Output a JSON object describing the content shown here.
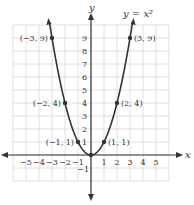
{
  "chart_data": {
    "type": "line",
    "title": "y = x²",
    "function_label": "y = x²",
    "xlabel": "x",
    "ylabel": "y",
    "xlim": [
      -6,
      6
    ],
    "ylim": [
      -2,
      10
    ],
    "grid": true,
    "x_ticks": [
      "−5",
      "−4",
      "−3",
      "−2",
      "−1",
      "1",
      "2",
      "3",
      "4",
      "5"
    ],
    "y_ticks": [
      "−1",
      "1",
      "2",
      "3",
      "4",
      "5",
      "6",
      "7",
      "8",
      "9"
    ],
    "series": [
      {
        "name": "y = x²",
        "x": [
          -3.2,
          -3,
          -2,
          -1,
          0,
          1,
          2,
          3,
          3.2
        ],
        "y": [
          10.24,
          9,
          4,
          1,
          0,
          1,
          4,
          9,
          10.24
        ]
      }
    ],
    "points": [
      {
        "x": -3,
        "y": 9,
        "label": "(−3, 9)"
      },
      {
        "x": -2,
        "y": 4,
        "label": "(−2, 4)"
      },
      {
        "x": -1,
        "y": 1,
        "label": "(−1, 1)"
      },
      {
        "x": 0,
        "y": 0,
        "label": ""
      },
      {
        "x": 1,
        "y": 1,
        "label": "(1, 1)"
      },
      {
        "x": 2,
        "y": 4,
        "label": "(2, 4)"
      },
      {
        "x": 3,
        "y": 9,
        "label": "(3, 9)"
      }
    ]
  }
}
